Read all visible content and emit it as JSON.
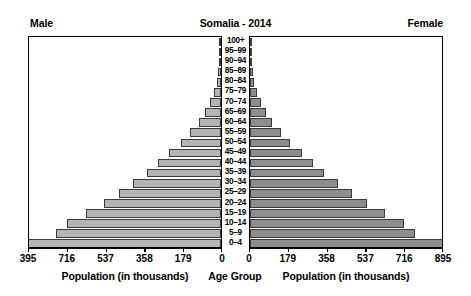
{
  "header": {
    "male_label": "Male",
    "female_label": "Female",
    "title": "Somalia - 2014"
  },
  "footer": {
    "left_axis_title": "Population (in thousands)",
    "center_axis_title": "Age Group",
    "right_axis_title": "Population (in thousands)"
  },
  "axes": {
    "left_ticks": [
      "395",
      "716",
      "537",
      "358",
      "179",
      "0"
    ],
    "right_ticks": [
      "0",
      "179",
      "358",
      "537",
      "716",
      "895"
    ]
  },
  "chart_data": {
    "type": "bar",
    "subtype": "population-pyramid",
    "title": "Somalia - 2014",
    "xlabel": "Population (in thousands)",
    "ylabel": "Age Group",
    "categories": [
      "100+",
      "95–99",
      "90–94",
      "85–89",
      "80–84",
      "75–79",
      "70–74",
      "65–69",
      "60–64",
      "55–59",
      "50–54",
      "45–49",
      "40–44",
      "35–39",
      "30–34",
      "25–29",
      "20–24",
      "15–19",
      "10–14",
      "5–9",
      "0–4"
    ],
    "series": [
      {
        "name": "Male",
        "color": "#b4b4b4",
        "side": "left",
        "values": [
          2,
          4,
          7,
          12,
          19,
          31,
          50,
          74,
          103,
          141,
          186,
          238,
          291,
          342,
          404,
          470,
          540,
          623,
          712,
          760,
          895
        ]
      },
      {
        "name": "Female",
        "color": "#8d8d8d",
        "side": "right",
        "values": [
          2,
          4,
          7,
          12,
          19,
          31,
          50,
          74,
          103,
          141,
          186,
          238,
          291,
          342,
          404,
          470,
          540,
          623,
          712,
          760,
          895
        ]
      }
    ],
    "xlim_left": [
      895,
      0
    ],
    "xlim_right": [
      0,
      895
    ],
    "axis_tick_values_left": [
      395,
      716,
      537,
      358,
      179,
      0
    ],
    "axis_tick_values_right": [
      0,
      179,
      358,
      537,
      716,
      895
    ],
    "grid": false,
    "legend": "none"
  }
}
